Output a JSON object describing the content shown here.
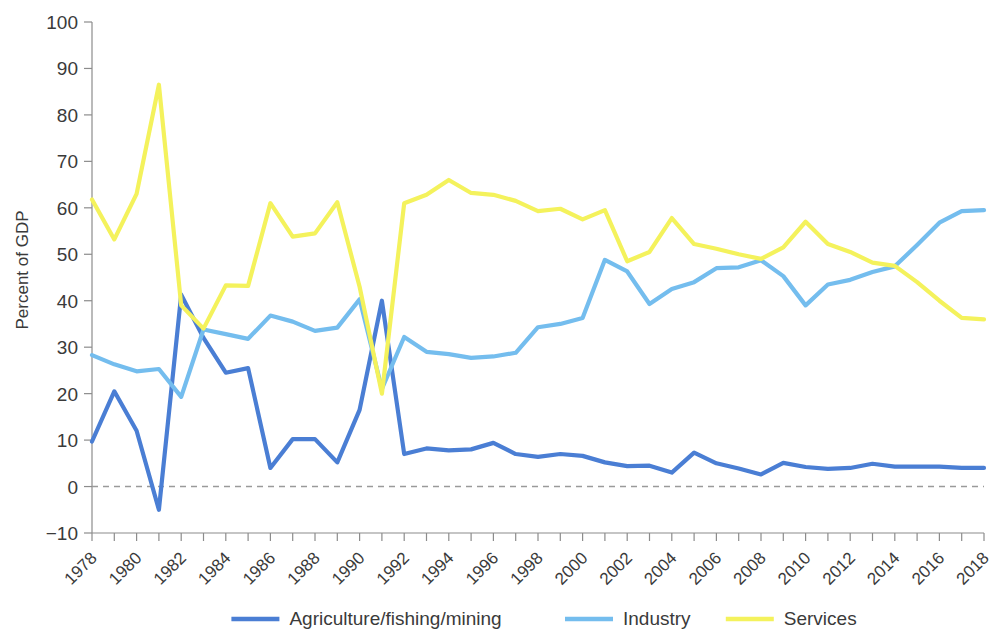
{
  "chart_data": {
    "type": "line",
    "title": "",
    "xlabel": "",
    "ylabel": "Percent of GDP",
    "ylim": [
      -10,
      100
    ],
    "ytick_values": [
      -10,
      0,
      10,
      20,
      30,
      40,
      50,
      60,
      70,
      80,
      90,
      100
    ],
    "ytick_labels": [
      "−10",
      "0",
      "10",
      "20",
      "30",
      "40",
      "50",
      "60",
      "70",
      "80",
      "90",
      "100"
    ],
    "xlim": [
      1978,
      2018
    ],
    "x": [
      1978,
      1979,
      1980,
      1981,
      1982,
      1983,
      1984,
      1985,
      1986,
      1987,
      1988,
      1989,
      1990,
      1991,
      1992,
      1993,
      1994,
      1995,
      1996,
      1997,
      1998,
      1999,
      2000,
      2001,
      2002,
      2003,
      2004,
      2005,
      2006,
      2007,
      2008,
      2009,
      2010,
      2011,
      2012,
      2013,
      2014,
      2015,
      2016,
      2017,
      2018
    ],
    "xtick_labels": [
      "1978",
      "1980",
      "1982",
      "1984",
      "1986",
      "1988",
      "1990",
      "1992",
      "1994",
      "1996",
      "1998",
      "2000",
      "2002",
      "2004",
      "2006",
      "2008",
      "2010",
      "2012",
      "2014",
      "2016",
      "2018"
    ],
    "xtick_step": 2,
    "grid": false,
    "zero_line": true,
    "legend_position": "bottom",
    "series": [
      {
        "name": "Agriculture/fishing/mining",
        "color": "#4a7ed4",
        "values": [
          9.7,
          20.5,
          12.0,
          -5.0,
          41.3,
          32.0,
          24.5,
          25.5,
          4.0,
          10.2,
          10.2,
          5.2,
          16.5,
          40.0,
          7.0,
          8.2,
          7.8,
          8.0,
          9.4,
          7.0,
          6.4,
          7.0,
          6.6,
          5.2,
          4.4,
          4.5,
          3.0,
          7.3,
          5.0,
          3.9,
          2.6,
          5.1,
          4.2,
          3.8,
          4.0,
          4.9,
          4.3,
          4.3,
          4.3,
          4.0,
          4.0
        ],
        "labeled_points": {
          "1978": 9.7,
          "1981": -5.0,
          "1982": 41.3,
          "1991": 40.0,
          "2018": 4.0
        }
      },
      {
        "name": "Industry",
        "color": "#74bdee",
        "values": [
          28.3,
          26.3,
          24.8,
          25.3,
          19.3,
          33.8,
          32.8,
          31.8,
          36.8,
          35.5,
          33.5,
          34.2,
          40.3,
          21.0,
          32.2,
          29.0,
          28.5,
          27.7,
          28.0,
          28.8,
          34.3,
          35.0,
          36.3,
          48.8,
          46.3,
          39.3,
          42.5,
          44.0,
          47.0,
          47.2,
          48.7,
          45.3,
          39.0,
          43.5,
          44.5,
          46.2,
          47.4,
          52.0,
          56.8,
          59.3,
          59.5
        ],
        "labeled_points": {
          "1978": 28.3,
          "1982": 19.3,
          "2001": 48.8,
          "2018": 59.5
        }
      },
      {
        "name": "Services",
        "color": "#f4f25c",
        "values": [
          61.8,
          53.2,
          63.0,
          86.5,
          39.0,
          34.0,
          43.3,
          43.2,
          61.0,
          53.8,
          54.5,
          61.2,
          43.0,
          20.0,
          61.0,
          62.8,
          66.0,
          63.2,
          62.8,
          61.5,
          59.3,
          59.8,
          57.5,
          59.5,
          48.5,
          50.5,
          57.8,
          52.2,
          51.2,
          50.0,
          49.0,
          51.5,
          57.0,
          52.2,
          50.5,
          48.2,
          47.5,
          44.0,
          40.0,
          36.3,
          36.0
        ],
        "labeled_points": {
          "1978": 61.8,
          "1981": 86.5,
          "1991": 20.0,
          "1994": 66.0,
          "2018": 36.0
        }
      }
    ]
  },
  "legend": {
    "items": [
      {
        "label": "Agriculture/fishing/mining",
        "color": "#4a7ed4"
      },
      {
        "label": "Industry",
        "color": "#74bdee"
      },
      {
        "label": "Services",
        "color": "#f4f25c"
      }
    ]
  }
}
